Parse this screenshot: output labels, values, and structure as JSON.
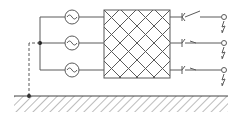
{
  "diagram": {
    "title": "Three-phase sources connected through a network to switched outputs with earth fault",
    "colors": {
      "line": "#5a5a5a",
      "background": "#ffffff"
    },
    "sources": [
      {
        "id": "source-1",
        "symbol": "~",
        "cx": 72,
        "cy": 17
      },
      {
        "id": "source-2",
        "symbol": "~",
        "cx": 72,
        "cy": 43
      },
      {
        "id": "source-3",
        "symbol": "~",
        "cx": 72,
        "cy": 70
      }
    ],
    "network_box": {
      "x": 104,
      "y": 10,
      "width": 66,
      "height": 68,
      "pattern": "diagonal-crosshatch"
    },
    "switches": [
      {
        "id": "switch-1",
        "state": "open",
        "y": 17
      },
      {
        "id": "switch-2",
        "state": "closed",
        "y": 43
      },
      {
        "id": "switch-3",
        "state": "closed",
        "y": 70
      }
    ],
    "terminals": [
      {
        "id": "terminal-1",
        "x": 224,
        "y": 17
      },
      {
        "id": "terminal-2",
        "x": 224,
        "y": 43
      },
      {
        "id": "terminal-3",
        "x": 224,
        "y": 70
      }
    ],
    "faults": [
      {
        "id": "fault-1",
        "y": 25
      },
      {
        "id": "fault-2",
        "y": 51
      },
      {
        "id": "fault-3",
        "y": 78
      }
    ],
    "ground": {
      "y": 96,
      "x1": 14,
      "x2": 228
    },
    "neutral_connection": {
      "style": "dashed",
      "from": "star-point",
      "to": "ground"
    }
  }
}
